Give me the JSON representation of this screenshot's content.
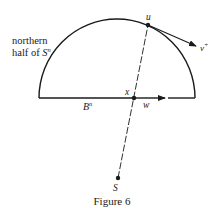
{
  "figure": {
    "caption": "Figure 6",
    "region_label_line1": "northern",
    "region_label_line2": "half of ",
    "region_label_sphere": "S",
    "region_label_sup": "n",
    "ball_label": "B",
    "ball_sup": "n",
    "points": {
      "u": "u",
      "x": "x",
      "S": "S"
    },
    "vectors": {
      "v_plus": "v",
      "v_plus_sup": "+",
      "w": "w"
    },
    "colors": {
      "ink": "#1a1a1a",
      "background": "#ffffff"
    }
  }
}
